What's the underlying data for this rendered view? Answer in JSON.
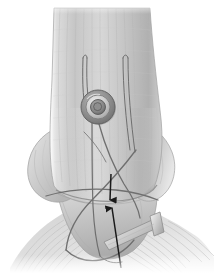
{
  "figure": {
    "title": "Syndesmotic suture-button fixation of the distal tibiofibular joint",
    "type": "anatomical-illustration",
    "style": "grayscale medical line-and-wash drawing",
    "background_color": "#ffffff",
    "canvas": {
      "width": 214,
      "height": 273
    },
    "palette": {
      "background": "#ffffff",
      "bone_light": "#e8e8e8",
      "bone_mid": "#c9c9c9",
      "bone_shadow": "#a8a8a8",
      "bone_dark": "#8f8f8f",
      "soft_tissue": "#d6d6d6",
      "tendon_line": "#b4b4b4",
      "suture_cord": "#6e6e6e",
      "implant_metal": "#7a7a7a",
      "implant_dark": "#4a4a4a",
      "arrow": "#1a1a1a",
      "outline": "#9a9a9a"
    },
    "anatomy": {
      "structures": [
        {
          "id": "tibia-shaft",
          "label": "Tibia (distal shaft)",
          "region": "upper center"
        },
        {
          "id": "medial-malleolus",
          "label": "Medial malleolus",
          "region": "left flare"
        },
        {
          "id": "lateral-malleolus",
          "label": "Lateral malleolus / fibula",
          "region": "right flare"
        },
        {
          "id": "talus-dome",
          "label": "Talar dome",
          "region": "lower center"
        },
        {
          "id": "ligament-fibers",
          "label": "Ligamentous / capsular fibers",
          "region": "lower spread"
        }
      ],
      "fiber_bands_count": 26,
      "shaft_striations_count": 16
    },
    "implant": {
      "device_label": "Suture-button syndesmosis device",
      "washer": {
        "label": "Washer / button head",
        "center": {
          "x": 98,
          "y": 107
        },
        "outer_radius": 17,
        "ring_radius": 12,
        "inner_radius": 7.5,
        "bore_radius": 4
      },
      "plate": {
        "label": "Oblong button plate",
        "region": "inferolateral"
      },
      "suture_strands": 4,
      "suture_tails": 2
    },
    "annotations": {
      "arrows": [
        {
          "id": "arrow-down",
          "label": "Direction-of-pull arrow (downward)",
          "direction": "down",
          "from": {
            "x": 111,
            "y": 174
          },
          "to": {
            "x": 110,
            "y": 200
          },
          "head_size": 6,
          "color": "#1a1a1a"
        },
        {
          "id": "arrow-up",
          "label": "Direction-of-pull arrow (upward)",
          "direction": "up",
          "from": {
            "x": 121,
            "y": 268
          },
          "to": {
            "x": 112,
            "y": 208
          },
          "head_size": 6,
          "color": "#1a1a1a"
        }
      ],
      "arrow_count": 2,
      "text_labels": []
    }
  }
}
